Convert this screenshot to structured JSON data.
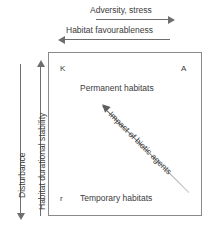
{
  "diagram": {
    "box": {
      "corners": {
        "top_left_marker": "K",
        "top_right_marker": "A",
        "bottom_left_marker": "r"
      },
      "zones": [
        {
          "label": "Permanent habitats",
          "position": "upper"
        },
        {
          "label": "Temporary habitats",
          "position": "lower"
        }
      ]
    },
    "axes": {
      "top": [
        {
          "label": "Adversity, stress",
          "direction": "right"
        },
        {
          "label": "Habitat favourableness",
          "direction": "left"
        }
      ],
      "left": [
        {
          "label": "Disturbance",
          "direction": "down"
        },
        {
          "label": "Habitat durational stability",
          "direction": "up"
        }
      ]
    },
    "diagonal": {
      "label": "Impact of biotic agents",
      "direction": "up-left"
    },
    "colors": {
      "line": "#6e6e6e",
      "box_border": "#8a8a8a",
      "text": "#3b3b3b",
      "background": "#ffffff"
    }
  }
}
